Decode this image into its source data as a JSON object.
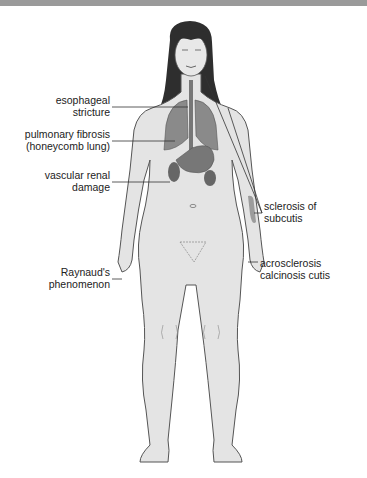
{
  "diagram": {
    "labels_left": [
      {
        "id": "esophageal",
        "lines": [
          "esophageal",
          "stricture"
        ]
      },
      {
        "id": "pulmonary",
        "lines": [
          "pulmonary fibrosis",
          "(honeycomb lung)"
        ]
      },
      {
        "id": "renal",
        "lines": [
          "vascular renal",
          "damage"
        ]
      },
      {
        "id": "raynaud",
        "lines": [
          "Raynaud's",
          "phenomenon"
        ]
      }
    ],
    "labels_right": [
      {
        "id": "sclerosis",
        "lines": [
          "sclerosis of",
          "subcutis"
        ]
      },
      {
        "id": "acrosclerosis",
        "lines": [
          "acrosclerosis",
          "calcinosis cutis"
        ]
      }
    ],
    "colors": {
      "skin": "#e4e4e4",
      "outline": "#555555",
      "hair": "#2e2e2e",
      "organ": "#8a8a8a",
      "organ_dark": "#666666",
      "lesion": "#9c9c9c",
      "topbar": "#9a9a9a"
    }
  }
}
